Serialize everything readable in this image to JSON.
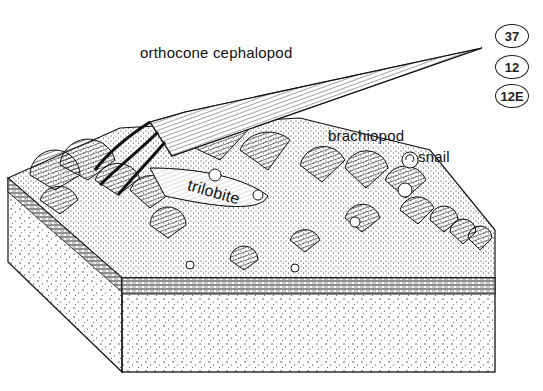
{
  "figure": {
    "type": "block diagram illustration"
  },
  "labels": {
    "cephalopod": "orthocone cephalopod",
    "brachiopod": "brachiopod",
    "snail": "snail",
    "trilobite": "trilobite"
  },
  "badges": [
    "37",
    "12",
    "12E"
  ],
  "colors": {
    "ink": "#111111",
    "paper": "#ffffff"
  }
}
